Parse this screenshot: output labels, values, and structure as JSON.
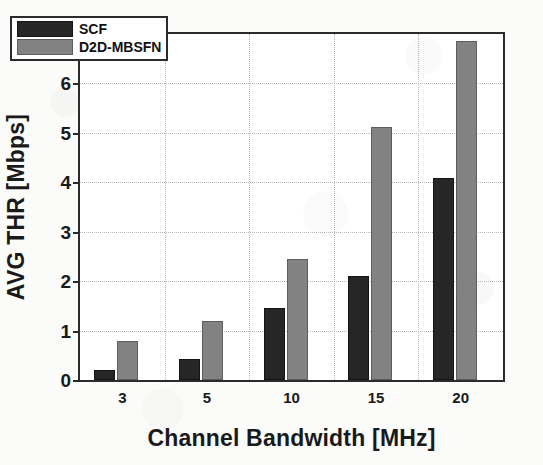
{
  "chart_data": {
    "type": "bar",
    "title": "",
    "xlabel": "Channel Bandwidth  [MHz]",
    "ylabel": "AVG THR [Mbps]",
    "categories": [
      "3",
      "5",
      "10",
      "15",
      "20"
    ],
    "series": [
      {
        "name": "SCF",
        "color": "#262626",
        "values": [
          0.2,
          0.42,
          1.45,
          2.1,
          4.08
        ]
      },
      {
        "name": "D2D-MBSFN",
        "color": "#828282",
        "values": [
          0.78,
          1.2,
          2.45,
          5.12,
          6.86
        ]
      }
    ],
    "ylim": [
      0,
      7
    ],
    "yticks": [
      "0",
      "1",
      "2",
      "3",
      "4",
      "5",
      "6",
      "7"
    ],
    "grid": true,
    "legend_position": "top-left"
  },
  "legend": {
    "items": [
      {
        "label": "SCF"
      },
      {
        "label": "D2D-MBSFN"
      }
    ]
  }
}
